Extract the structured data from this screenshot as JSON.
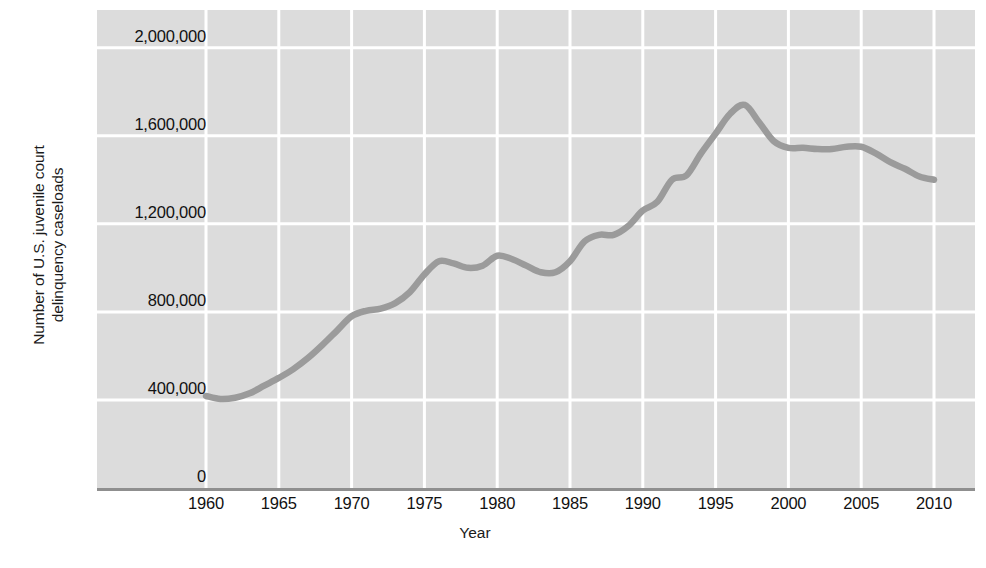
{
  "chart_data": {
    "type": "line",
    "title": "",
    "xlabel": "Year",
    "ylabel_line1": "Number of U.S. juvenile court",
    "ylabel_line2": "delinquency caseloads",
    "xlim": [
      1957.5,
      2012.5
    ],
    "ylim": [
      0,
      2000000
    ],
    "grid": true,
    "legend": "none",
    "plot_background": "#dcdcdc",
    "gridline_color": "#ffffff",
    "line_color": "#9b9b9b",
    "axis_color": "#8f8f8f",
    "x_ticks": [
      1960,
      1965,
      1970,
      1975,
      1980,
      1985,
      1990,
      1995,
      2000,
      2005,
      2010
    ],
    "x_tick_labels": [
      "1960",
      "1965",
      "1970",
      "1975",
      "1980",
      "1985",
      "1990",
      "1995",
      "2000",
      "2005",
      "2010"
    ],
    "y_ticks": [
      0,
      400000,
      800000,
      1200000,
      1600000,
      2000000
    ],
    "y_tick_labels": [
      "0",
      "400,000",
      "800,000",
      "1,200,000",
      "1,600,000",
      "2,000,000"
    ],
    "x": [
      1960,
      1961,
      1962,
      1963,
      1964,
      1965,
      1966,
      1967,
      1968,
      1969,
      1970,
      1971,
      1972,
      1973,
      1974,
      1975,
      1976,
      1977,
      1978,
      1979,
      1980,
      1981,
      1982,
      1983,
      1984,
      1985,
      1986,
      1987,
      1988,
      1989,
      1990,
      1991,
      1992,
      1993,
      1994,
      1995,
      1996,
      1997,
      1998,
      1999,
      2000,
      2001,
      2002,
      2003,
      2004,
      2005,
      2006,
      2007,
      2008,
      2009,
      2010
    ],
    "series": [
      {
        "name": "U.S. juvenile court delinquency caseloads",
        "values": [
          418000,
          404000,
          410000,
          430000,
          465000,
          500000,
          540000,
          590000,
          650000,
          715000,
          780000,
          805000,
          815000,
          840000,
          890000,
          970000,
          1030000,
          1020000,
          1000000,
          1010000,
          1055000,
          1040000,
          1010000,
          980000,
          980000,
          1030000,
          1120000,
          1150000,
          1150000,
          1190000,
          1260000,
          1300000,
          1400000,
          1420000,
          1520000,
          1610000,
          1700000,
          1740000,
          1660000,
          1575000,
          1545000,
          1545000,
          1540000,
          1540000,
          1550000,
          1550000,
          1520000,
          1480000,
          1450000,
          1415000,
          1400000
        ]
      }
    ]
  }
}
